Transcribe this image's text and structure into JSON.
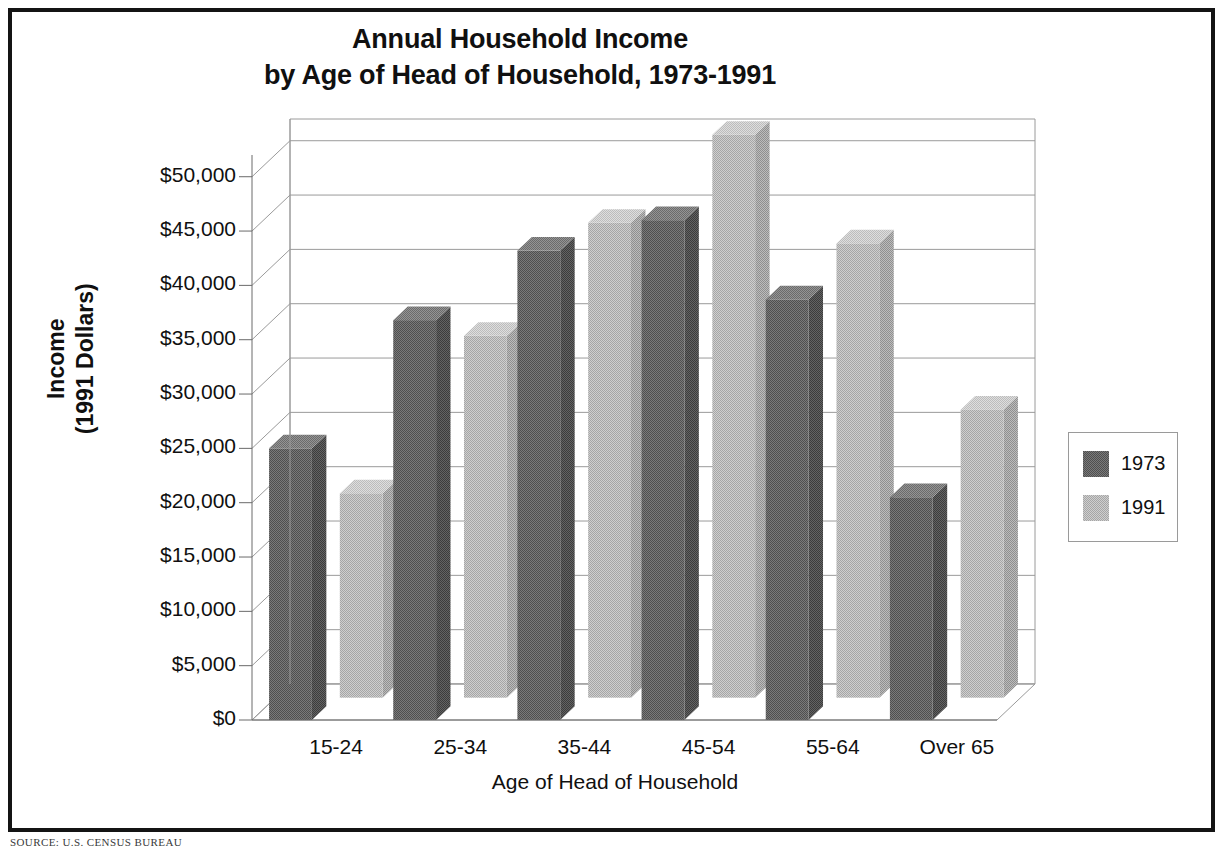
{
  "title": {
    "line1": "Annual Household Income",
    "line2": "by Age of Head of Household, 1973-1991"
  },
  "y_axis_title": {
    "line1": "Income",
    "line2": "(1991 Dollars)"
  },
  "x_axis_title": "Age of Head of Household",
  "source_note": "SOURCE:  U.S.  CENSUS BUREAU",
  "legend": {
    "items": [
      {
        "label": "1973",
        "color": "#6e6e6e"
      },
      {
        "label": "1991",
        "color": "#b9b9b9"
      }
    ]
  },
  "colors": {
    "series_1973_front": "#6e6e6e",
    "series_1973_top": "#8a8a8a",
    "series_1973_side": "#565656",
    "series_1991_front": "#bdbdbd",
    "series_1991_top": "#d2d2d2",
    "series_1991_side": "#a4a4a4",
    "gridline": "#9a9a9a",
    "axis": "#6a6a6a",
    "frame": "#141414",
    "text": "#101010"
  },
  "chart_data": {
    "type": "bar",
    "title": "Annual Household Income by Age of Head of Household, 1973-1991",
    "xlabel": "Age of Head of Household",
    "ylabel": "Income (1991 Dollars)",
    "ylim": [
      0,
      52000
    ],
    "grid": true,
    "legend_position": "right",
    "categories": [
      "15-24",
      "25-34",
      "35-44",
      "45-54",
      "55-64",
      "Over 65"
    ],
    "ytick_labels": [
      "$0",
      "$5,000",
      "$10,000",
      "$15,000",
      "$20,000",
      "$25,000",
      "$30,000",
      "$35,000",
      "$40,000",
      "$45,000",
      "$50,000"
    ],
    "ytick_values": [
      0,
      5000,
      10000,
      15000,
      20000,
      25000,
      30000,
      35000,
      40000,
      45000,
      50000
    ],
    "series": [
      {
        "name": "1973",
        "values": [
          25000,
          36800,
          43200,
          46000,
          38700,
          20500
        ]
      },
      {
        "name": "1991",
        "values": [
          18800,
          33300,
          43700,
          51800,
          41800,
          26500
        ]
      }
    ]
  }
}
